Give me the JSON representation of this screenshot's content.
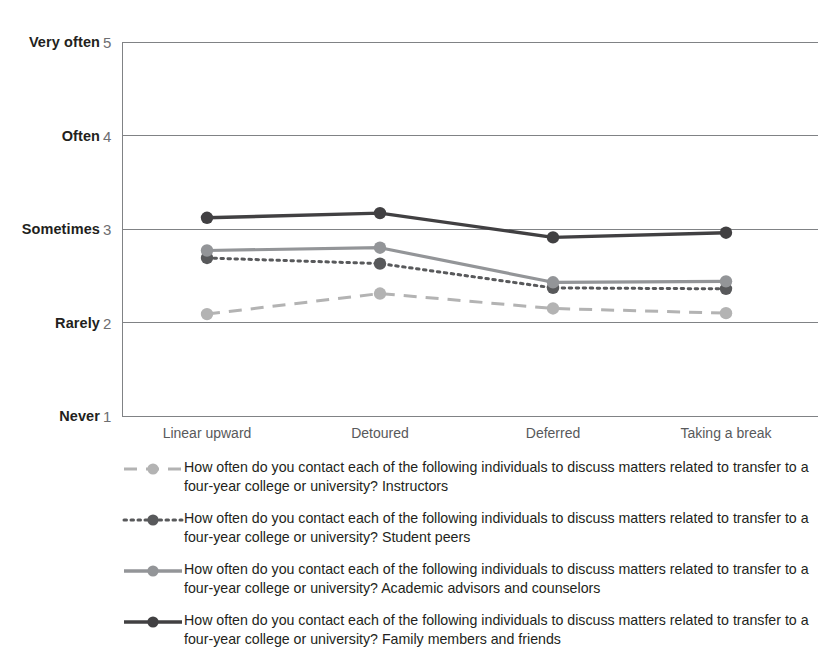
{
  "chart_data": {
    "type": "line",
    "title": "",
    "xlabel": "",
    "ylabel": "",
    "ylim": [
      1,
      5
    ],
    "grid": true,
    "legend_position": "bottom",
    "categories": [
      "Linear upward",
      "Detoured",
      "Deferred",
      "Taking a break"
    ],
    "y_tick_values": [
      1,
      2,
      3,
      4,
      5
    ],
    "y_tick_words": [
      "Never",
      "Rarely",
      "Sometimes",
      "Often",
      "Very often"
    ],
    "series": [
      {
        "name": "How often do you contact each of the following individuals to discuss matters related to transfer to a four-year college or university? Instructors",
        "short_name": "Instructors",
        "style": "dashed",
        "color": "#b3b3b3",
        "values": [
          2.09,
          2.31,
          2.15,
          2.1
        ]
      },
      {
        "name": "How often do you contact each of the following individuals to discuss matters related to transfer to a four-year college or university? Student peers",
        "short_name": "Student peers",
        "style": "dotted",
        "color": "#58595b",
        "values": [
          2.69,
          2.63,
          2.37,
          2.36
        ]
      },
      {
        "name": "How often do you contact each of the following individuals to discuss matters related to transfer to a four-year college or university? Academic advisors and counselors",
        "short_name": "Academic advisors and counselors",
        "style": "solid",
        "color": "#939598",
        "values": [
          2.77,
          2.8,
          2.43,
          2.44
        ]
      },
      {
        "name": "How often do you contact each of the following individuals to discuss matters related to transfer to a four-year college or university? Family members and friends",
        "short_name": "Family members and friends",
        "style": "solid",
        "color": "#414042",
        "values": [
          3.12,
          3.17,
          2.91,
          2.96
        ]
      }
    ]
  },
  "axes": {
    "y_labels": [
      {
        "word": "Very often",
        "num": "5"
      },
      {
        "word": "Often",
        "num": "4"
      },
      {
        "word": "Sometimes",
        "num": "3"
      },
      {
        "word": "Rarely",
        "num": "2"
      },
      {
        "word": "Never",
        "num": "1"
      }
    ]
  },
  "legend": {
    "entries": [
      {
        "label": "How often do you contact each of the following individuals to discuss matters related to transfer to a four-year college or university? Instructors"
      },
      {
        "label": "How often do you contact each of the following individuals to discuss matters related to transfer to a four-year college or university? Student peers"
      },
      {
        "label": "How often do you contact each of the following individuals to discuss matters related to transfer to a four-year college or university? Academic advisors and counselors"
      },
      {
        "label": "How often do you contact each of the following individuals to discuss matters related to transfer to a four-year college or university? Family members and friends"
      }
    ]
  },
  "colors": {
    "grid": "#808285",
    "axis": "#808285",
    "series_light": "#b3b3b3",
    "series_medium": "#939598",
    "series_dark_dot": "#58595b",
    "series_dark": "#414042",
    "text": "#231f20",
    "tick_text": "#58595b"
  }
}
